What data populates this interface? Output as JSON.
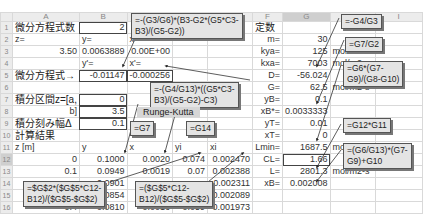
{
  "columns": [
    "",
    "A",
    "B",
    "C",
    "D",
    "E",
    "F",
    "G",
    "H",
    "I"
  ],
  "rows": [
    {
      "n": "1",
      "A": "微分方程式数",
      "B": "2",
      "C": "",
      "D": "",
      "E": "",
      "F": "定数",
      "G": "",
      "H": ""
    },
    {
      "n": "2",
      "A": "z=",
      "B": "y=",
      "C": "x=",
      "D": "",
      "E": "",
      "F": "m=",
      "G": "30",
      "H": ""
    },
    {
      "n": "3",
      "A": "3.50",
      "B": "0.0063889",
      "C": "0.00E+00",
      "D": "",
      "E": "",
      "F": "kya=",
      "G": "125",
      "H": "mol/m2-s"
    },
    {
      "n": "4",
      "A": "",
      "B": "y'=",
      "C": "x'=",
      "D": "",
      "E": "",
      "F": "kxa=",
      "G": "7003",
      "H": "mol/m2-s"
    },
    {
      "n": "5",
      "A": "微分方程式→",
      "B": "-0.01147",
      "C": "-0.000256",
      "D": "",
      "E": "",
      "F": "D=",
      "G": "-56.024",
      "H": ""
    },
    {
      "n": "6",
      "A": "",
      "B": "",
      "C": "",
      "D": "",
      "E": "",
      "F": "G=",
      "G": "62.5",
      "H": "mol/m2-s"
    },
    {
      "n": "7",
      "A": "積分区間z=[a,",
      "B": "0",
      "C": "",
      "D": "",
      "E": "",
      "F": "yB=",
      "G": "0.1",
      "H": ""
    },
    {
      "n": "8",
      "A": "b]",
      "B": "3.5",
      "C": "",
      "D": "",
      "E": "",
      "F": "xB*=",
      "G": "0.0033333",
      "H": ""
    },
    {
      "n": "9",
      "A": "積分刻み幅Δ",
      "B": "0.1",
      "C": "",
      "D": "",
      "E": "",
      "F": "yT=",
      "G": "0.01",
      "H": ""
    },
    {
      "n": "10",
      "A": "計算結果",
      "B": "",
      "C": "",
      "D": "",
      "E": "",
      "F": "xT=",
      "G": "0",
      "H": ""
    },
    {
      "n": "11",
      "A": "z [m]",
      "B": "y",
      "C": "x",
      "D": "yi",
      "E": "xi",
      "F": "Lmin=",
      "G": "1687.5",
      "H": "mol/m2-s"
    },
    {
      "n": "12",
      "A": "0",
      "B": "0.1000",
      "C": "0.0020",
      "D": "0.074",
      "E": "0.002470",
      "F": "CL=",
      "G": "1.66",
      "H": ""
    },
    {
      "n": "13",
      "A": "0.1",
      "B": "0.0949",
      "C": "0.0019",
      "D": "0.07",
      "E": "0.002388",
      "F": "L=",
      "G": "2801.3",
      "H": "mol/m2-s"
    },
    {
      "n": "14",
      "A": "",
      "B": "0.0901",
      "C": "",
      "D": "",
      "E": "0.002311",
      "F": "xB=",
      "G": "0.002008",
      "H": ""
    },
    {
      "n": "15",
      "A": "",
      "B": "0.0854",
      "C": "",
      "D": "",
      "E": "0.002089",
      "F": "",
      "G": "",
      "H": ""
    },
    {
      "n": "16",
      "A": "0.4",
      "B": "0.0810",
      "C": "0.0016",
      "D": "0.059",
      "E": "0.001973",
      "F": "",
      "G": "",
      "H": ""
    }
  ],
  "callouts": {
    "c1": "=-(G3/G6)*(B3-G2*(G5*C3-\nB3)/(G5-G2))",
    "c2": "=-(G4/G13)*((G5*C3-\nB3)/(G5-G2)-C3)",
    "c3": "=G7",
    "c4": "=G14",
    "c5": "=$G$2*($G$5*C12-\nB12)/($G$5-$G$2)",
    "c6": "=($G$5*C12-\nB12)/($G$5-$G$2)",
    "g1": "=-G4/G3",
    "g2": "=G7/G2",
    "g3": "=G6*(G7-\nG9)/(G8-G10)",
    "g4": "=G12*G11",
    "g5": "=(G6/G13)*(G7-\nG9)+G10"
  },
  "runge_kutta_label": "Runge-Kutta",
  "colors": {
    "header_bg": "#ececec",
    "callout_bg": "#e4e4e4",
    "grid": "#d9d9d9"
  }
}
